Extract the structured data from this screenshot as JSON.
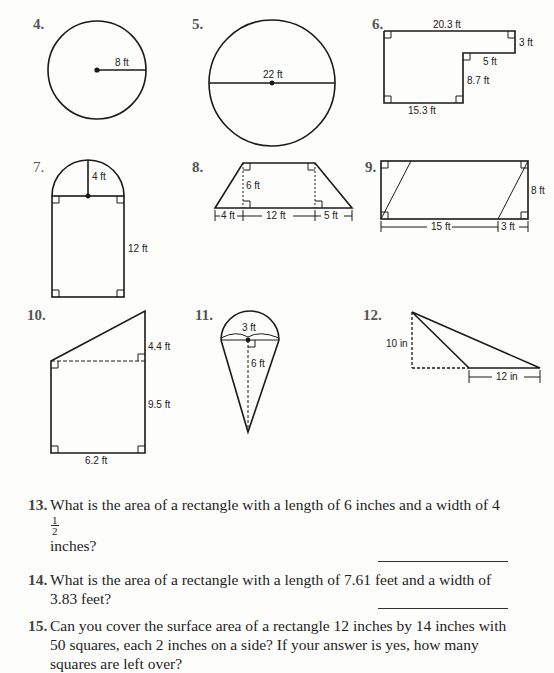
{
  "figures": [
    {
      "number": "4.",
      "shape": "circle",
      "labels": [
        "8 ft"
      ],
      "label_meaning": "radius"
    },
    {
      "number": "5.",
      "shape": "circle",
      "labels": [
        "22 ft"
      ],
      "label_meaning": "diameter"
    },
    {
      "number": "6.",
      "shape": "L-shaped polygon",
      "labels": [
        "20.3 ft",
        "3 ft",
        "5 ft",
        "8.7 ft",
        "15.3 ft"
      ]
    },
    {
      "number": "7.",
      "shape": "rectangle with semicircle",
      "labels": [
        "4 ft",
        "12 ft"
      ]
    },
    {
      "number": "8.",
      "shape": "trapezoid",
      "labels": [
        "6 ft",
        "4 ft",
        "12 ft",
        "5 ft"
      ]
    },
    {
      "number": "9.",
      "shape": "rectangle with parallelogram",
      "labels": [
        "8 ft",
        "15 ft",
        "3 ft"
      ]
    },
    {
      "number": "10.",
      "shape": "trapezoid (right)",
      "labels": [
        "4.4 ft",
        "9.5 ft",
        "6.2 ft"
      ]
    },
    {
      "number": "11.",
      "shape": "cone with semicircle",
      "labels": [
        "3 ft",
        "6 ft"
      ]
    },
    {
      "number": "12.",
      "shape": "obtuse triangle",
      "labels": [
        "10 in",
        "12 in"
      ]
    }
  ],
  "questions": [
    {
      "number": "13.",
      "text_before": "What is the area of a rectangle with a length of 6 inches and a width of 4",
      "fraction": {
        "whole": "",
        "numerator": "1",
        "denominator": "2"
      },
      "text_after": " inches?"
    },
    {
      "number": "14.",
      "text": "What is the area of a rectangle with a length of 7.61 feet and a width of 3.83 feet?"
    },
    {
      "number": "15.",
      "text": "Can you cover the surface area of a rectangle 12 inches by 14 inches with 50 squares, each 2 inches on a side? If your answer is yes, how many squares are left over?"
    }
  ]
}
